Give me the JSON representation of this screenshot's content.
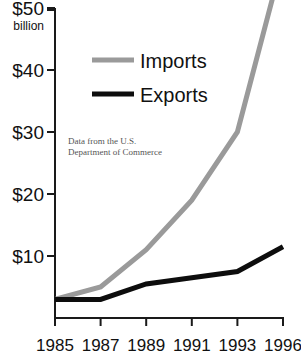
{
  "chart_data": {
    "type": "line",
    "title": "",
    "xlabel": "",
    "ylabel": "",
    "y_unit_label": "billion",
    "categories": [
      "1985",
      "1987",
      "1989",
      "1991",
      "1993",
      "1996"
    ],
    "x_tick_labels": [
      "1985",
      "1987",
      "1989",
      "1991",
      "1993",
      "1996"
    ],
    "y_tick_labels": [
      "$10",
      "$20",
      "$30",
      "$40",
      "$50"
    ],
    "y_tick_values": [
      10,
      20,
      30,
      40,
      50
    ],
    "ylim": [
      0,
      50
    ],
    "grid": false,
    "legend_position": "upper-center",
    "series": [
      {
        "name": "Imports",
        "color": "#9a9a9a",
        "values": [
          3,
          5,
          11,
          19,
          30,
          58
        ]
      },
      {
        "name": "Exports",
        "color": "#0d0d0d",
        "values": [
          3,
          3,
          5.5,
          6.5,
          7.5,
          11.5
        ]
      }
    ],
    "annotations": [
      "Data from the U.S.",
      "Department of Commerce"
    ]
  },
  "legend": {
    "items": [
      {
        "label": "Imports",
        "color": "#9a9a9a"
      },
      {
        "label": "Exports",
        "color": "#0d0d0d"
      }
    ]
  },
  "colors": {
    "imports": "#9a9a9a",
    "exports": "#0d0d0d",
    "axis": "#1a1a1a",
    "text": "#111111",
    "note": "#555555",
    "background": "#ffffff"
  }
}
